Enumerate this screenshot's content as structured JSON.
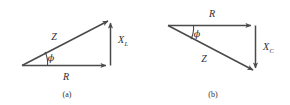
{
  "figure": {
    "stroke_color": "#4a4a4a",
    "label_color": "#2e2e2e",
    "background": "#ffffff",
    "panels": [
      {
        "id": "a",
        "caption": "(a)",
        "type": "impedance-triangle-inductive",
        "vectors": [
          {
            "name": "R",
            "label": "R",
            "label_sub": "",
            "orientation": "horizontal-right",
            "description": "resistance vector along base pointing right"
          },
          {
            "name": "XL",
            "label": "X",
            "label_sub": "L",
            "orientation": "vertical-up",
            "description": "inductive reactance vector pointing up"
          },
          {
            "name": "Z",
            "label": "Z",
            "label_sub": "",
            "orientation": "diagonal-up-right",
            "description": "impedance hypotenuse pointing up and to the right"
          }
        ],
        "angle": {
          "name": "phi",
          "label": "ϕ",
          "description": "phase angle between R and Z at left vertex"
        }
      },
      {
        "id": "b",
        "caption": "(b)",
        "type": "impedance-triangle-capacitive",
        "vectors": [
          {
            "name": "R",
            "label": "R",
            "label_sub": "",
            "orientation": "horizontal-right",
            "description": "resistance vector along top pointing right"
          },
          {
            "name": "XC",
            "label": "X",
            "label_sub": "C",
            "orientation": "vertical-down",
            "description": "capacitive reactance vector pointing down"
          },
          {
            "name": "Z",
            "label": "Z",
            "label_sub": "",
            "orientation": "diagonal-down-right",
            "description": "impedance hypotenuse pointing down and to the right"
          }
        ],
        "angle": {
          "name": "phi",
          "label": "ϕ",
          "description": "phase angle between R and Z at left vertex"
        }
      }
    ]
  }
}
